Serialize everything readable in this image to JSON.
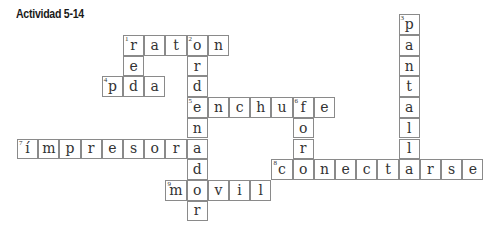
{
  "title": "Actividad 5-14",
  "grid": {
    "origin_x": 17,
    "origin_y": 35,
    "step_x": 21.2,
    "step_y": 20.7
  },
  "words": [
    {
      "number": 1,
      "direction": "across",
      "answer": "raton",
      "row": 0,
      "col": 5
    },
    {
      "number": 2,
      "direction": "down",
      "answer": "ordenador",
      "row": 0,
      "col": 8
    },
    {
      "number": 3,
      "direction": "down",
      "answer": "pantalla",
      "row": -1,
      "col": 18
    },
    {
      "number": 4,
      "direction": "across",
      "answer": "pda",
      "row": 2,
      "col": 4
    },
    {
      "number": 5,
      "direction": "across",
      "answer": "enchufe",
      "row": 3,
      "col": 8
    },
    {
      "number": 6,
      "direction": "down",
      "answer": "foro",
      "row": 3,
      "col": 13
    },
    {
      "number": 7,
      "direction": "across",
      "answer": "ímpresora",
      "row": 5,
      "col": 0
    },
    {
      "number": 8,
      "direction": "across",
      "answer": "conectarse",
      "row": 6,
      "col": 12
    },
    {
      "number": 9,
      "direction": "across",
      "answer": "movil",
      "row": 7,
      "col": 7
    },
    {
      "number": null,
      "direction": "down",
      "answer": "red",
      "row": 0,
      "col": 5
    }
  ]
}
